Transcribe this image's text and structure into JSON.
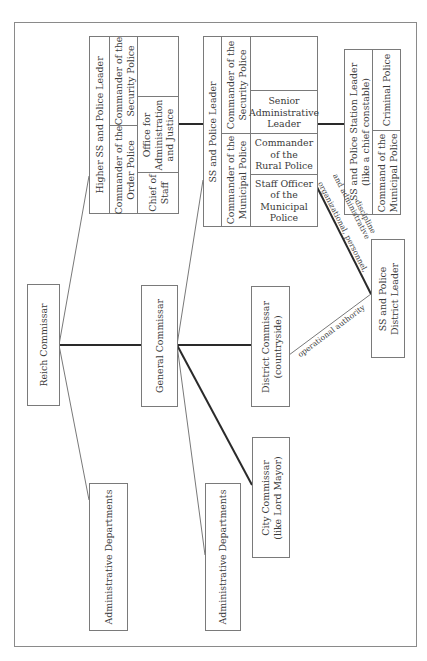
{
  "diagram": {
    "type": "organizational-chart",
    "orientation": "rotated-90-ccw",
    "nodes": {
      "reich_commissar": "Reich Commissar",
      "general_commissar": "General Commissar",
      "admin_departments_1": "Administrative Departments",
      "admin_departments_2": "Administrative Departments",
      "district_commissar": "District Commissar\n(countryside)",
      "city_commissar": "City Commissar\n(like Lord Mayor)",
      "higher_ss": {
        "title": "Higher SS and Police Leader",
        "commander_order_police": "Commander of the\nOrder Police",
        "commander_security_police": "Commander of the\nSecurity Police",
        "chief_of_staff": "Chief of\nStaff",
        "office_admin_justice": "Office for\nAdministration\nand Justice"
      },
      "ss_police_leader": {
        "title": "SS and Police Leader",
        "commander_municipal_police": "Commander of the\nMunicipal Police",
        "commander_security_police": "Commander of the\nSecurity Police",
        "senior_admin_leader": "Senior\nAdministrative\nLeader",
        "commander_rural_police": "Commander\nof the\nRural Police",
        "staff_officer_municipal": "Staff Officer\nof the\nMunicipal\nPolice"
      },
      "station_leader": {
        "title": "SS and Police Station Leader\n(like a chief constable)",
        "criminal_police": "Criminal Police",
        "command_municipal_police": "Command of the\nMunicipal Police"
      },
      "district_leader": "SS and Police\nDistrict Leader"
    },
    "edge_labels": {
      "org_personnel": "organizational, personnel,",
      "admin_discipline": "and administrative",
      "discipline": "discipline",
      "operational_authority": "operational authority"
    },
    "colors": {
      "line": "#2a2a2a",
      "thin_line": "#555555",
      "box_border": "#7a7a7a",
      "text": "#3a3a3a"
    }
  }
}
